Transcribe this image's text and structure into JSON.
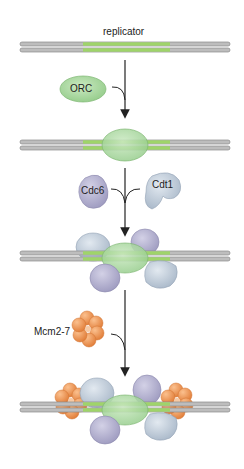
{
  "diagram": {
    "labels": {
      "replicator": "replicator",
      "orc": "ORC",
      "cdc6": "Cdc6",
      "cdt1": "Cdt1",
      "mcm": "Mcm2-7"
    },
    "stages": [
      {
        "step": 1,
        "state": "replicator DNA (naked)"
      },
      {
        "step": 2,
        "state": "ORC bound to replicator"
      },
      {
        "step": 3,
        "state": "ORC + Cdc6 + Cdt1 bound"
      },
      {
        "step": 4,
        "state": "ORC + Cdc6 + Cdt1 + Mcm2-7 loaded (pre-RC)"
      }
    ],
    "colors": {
      "dna_gray": "#b9b9b9",
      "replicator_green": "#9fd46a",
      "orc_green": "#a9d8a0",
      "cdc6_purple": "#b4b2cf",
      "cdt1_blue": "#c3cfdc",
      "mcm_orange": "#f09a58",
      "arrow": "#222222"
    }
  }
}
